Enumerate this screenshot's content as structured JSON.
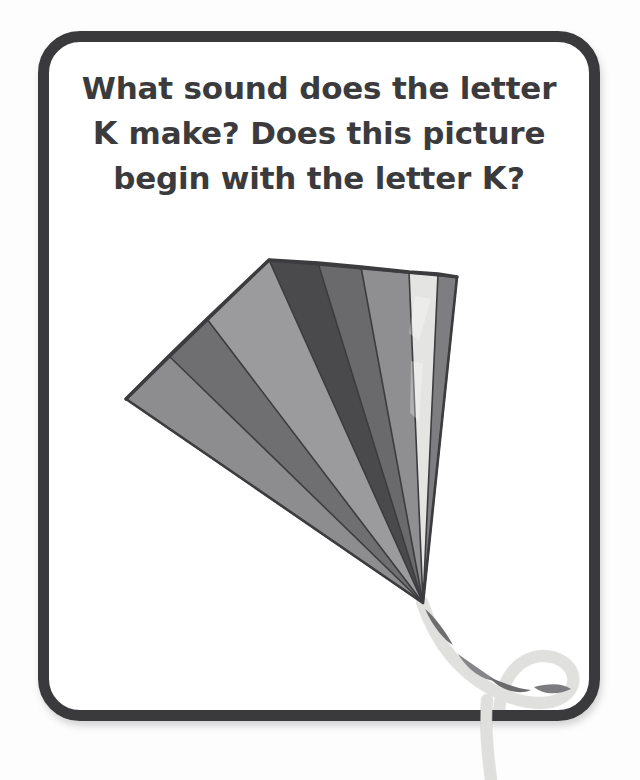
{
  "page": {
    "background_color": "#fdfdfd",
    "width": 640,
    "height": 780
  },
  "flashcard": {
    "border_color": "#3a3a3c",
    "border_width_px": 11,
    "corner_radius_px": 42,
    "background_color": "#ffffff",
    "shadow": true
  },
  "prompt": {
    "text_color": "#3b3b3d",
    "full_text": "What sound does the letter K make? Does this picture begin with the letter K?",
    "lines": [
      {
        "before": "What sound does the letter",
        "letter": "",
        "after": ""
      },
      {
        "before": "",
        "letter": "K",
        "after": " make? Does this picture"
      },
      {
        "before": "begin with the letter ",
        "letter": "K",
        "after": "?"
      }
    ],
    "target_letter": "K"
  },
  "illustration": {
    "name": "kite",
    "subject_label": "kite",
    "description": "A fan-shaped kite with eight wedge panels in shades of grey and a twisted ribbon tail",
    "apex": {
      "x": 412,
      "y": 592
    },
    "panels": [
      {
        "id": "panel-1",
        "color": "#8d8d8f",
        "top_x": 115,
        "top_y": 388
      },
      {
        "id": "panel-2",
        "color": "#6f6f72",
        "top_x": 158,
        "top_y": 345
      },
      {
        "id": "panel-3",
        "color": "#9b9b9d",
        "top_x": 196,
        "top_y": 308
      },
      {
        "id": "panel-4",
        "color": "#4a4a4d",
        "top_x": 258,
        "top_y": 249
      },
      {
        "id": "panel-5",
        "color": "#6a6a6d",
        "top_x": 307,
        "top_y": 252
      },
      {
        "id": "panel-6",
        "color": "#8f8f92",
        "top_x": 350,
        "top_y": 256
      },
      {
        "id": "panel-7",
        "color": "#e4e4e2",
        "top_x": 398,
        "top_y": 261
      },
      {
        "id": "panel-8",
        "color": "#7e7e81",
        "top_x": 446,
        "top_y": 266
      }
    ],
    "outline_color": "#3c3c3e",
    "tail": {
      "ribbon_color": "#f2f2f0",
      "twist_color": "#767679",
      "description": "twisted ribbon tail looping below the card"
    }
  }
}
